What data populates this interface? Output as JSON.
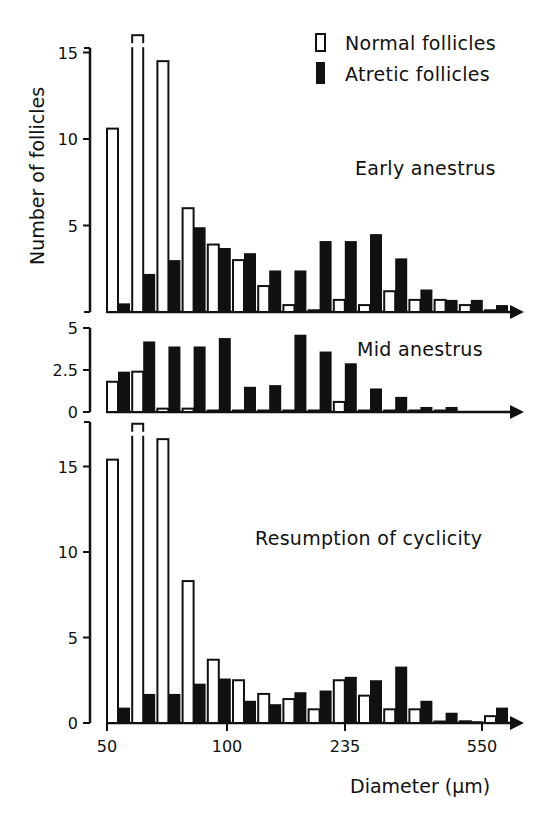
{
  "chart_data": {
    "type": "bar",
    "xlabel": "Diameter (µm)",
    "ylabel": "Number of follicles",
    "x_tick_labels": [
      "50",
      "100",
      "235",
      "550"
    ],
    "legend": [
      {
        "name": "Normal follicles",
        "style": "open"
      },
      {
        "name": "Atretic follicles",
        "style": "filled"
      }
    ],
    "legend_position": "top-right",
    "grid": false,
    "panels": [
      {
        "title": "Early anestrus",
        "yticks": [
          5,
          10,
          15
        ],
        "ylim": [
          0,
          16
        ],
        "categories": [
          "1",
          "2",
          "3",
          "4",
          "5",
          "6",
          "7",
          "8",
          "9",
          "10",
          "11",
          "12",
          "13",
          "14",
          "15",
          "16"
        ],
        "series": [
          {
            "name": "Normal follicles",
            "values": [
              10.6,
              16.0,
              14.5,
              6.0,
              3.9,
              3.0,
              1.5,
              0.4,
              0.1,
              0.7,
              0.4,
              1.2,
              0.7,
              0.7,
              0.4,
              0.1
            ],
            "broken_bars": [
              1
            ]
          },
          {
            "name": "Atretic follicles",
            "values": [
              0.5,
              2.2,
              3.0,
              4.9,
              3.7,
              3.4,
              2.4,
              2.4,
              4.1,
              4.1,
              4.5,
              3.1,
              1.3,
              0.7,
              0.7,
              0.4
            ]
          }
        ]
      },
      {
        "title": "Mid anestrus",
        "yticks": [
          0,
          2.5,
          5
        ],
        "ylim": [
          0,
          5
        ],
        "categories": [
          "1",
          "2",
          "3",
          "4",
          "5",
          "6",
          "7",
          "8",
          "9",
          "10",
          "11",
          "12",
          "13",
          "14"
        ],
        "series": [
          {
            "name": "Normal follicles",
            "values": [
              1.8,
              2.4,
              0.2,
              0.2,
              0.05,
              0.05,
              0.05,
              0.05,
              0.05,
              0.6,
              0.05,
              0.05,
              0.05,
              0.05
            ]
          },
          {
            "name": "Atretic follicles",
            "values": [
              2.4,
              4.2,
              3.9,
              3.9,
              4.4,
              1.5,
              1.6,
              4.6,
              3.6,
              2.9,
              1.4,
              0.9,
              0.3,
              0.3
            ]
          }
        ]
      },
      {
        "title": "Resumption of cyclicity",
        "yticks": [
          0,
          5,
          10,
          15
        ],
        "ylim": [
          0,
          17.5
        ],
        "categories": [
          "1",
          "2",
          "3",
          "4",
          "5",
          "6",
          "7",
          "8",
          "9",
          "10",
          "11",
          "12",
          "13",
          "14",
          "15",
          "16"
        ],
        "series": [
          {
            "name": "Normal follicles",
            "values": [
              15.4,
              17.5,
              16.6,
              8.3,
              3.7,
              2.5,
              1.7,
              1.4,
              0.8,
              2.5,
              1.6,
              0.8,
              0.8,
              0.0,
              0.1,
              0.4
            ],
            "broken_bars": [
              1
            ]
          },
          {
            "name": "Atretic follicles",
            "values": [
              0.9,
              1.7,
              1.7,
              2.3,
              2.6,
              1.3,
              1.1,
              1.8,
              1.9,
              2.7,
              2.5,
              3.3,
              1.3,
              0.6,
              0.1,
              0.9
            ]
          }
        ]
      }
    ]
  },
  "layout": {
    "bar_color_normal": "#ffffff",
    "bar_color_atretic": "#111111",
    "stroke_color": "#111111",
    "x0": 107,
    "pitch": 25.2,
    "bar_w": 11,
    "panels": [
      {
        "y_base": 312,
        "y_top": 48,
        "px_per_unit": 17.3,
        "axis_x": 90,
        "x_end": 520,
        "title_x": 355,
        "title_y": 175,
        "ymax_px": 52
      },
      {
        "y_base": 412,
        "y_top": 328,
        "px_per_unit": 16.8,
        "axis_x": 90,
        "x_end": 520,
        "title_x": 357,
        "title_y": 356,
        "ymax_px": 328
      },
      {
        "y_base": 723,
        "y_top": 422,
        "px_per_unit": 17.1,
        "axis_x": 90,
        "x_end": 520,
        "title_x": 255,
        "title_y": 545,
        "ymax_px": 424
      }
    ],
    "x_tick_px": [
      107,
      227,
      345,
      482
    ]
  }
}
